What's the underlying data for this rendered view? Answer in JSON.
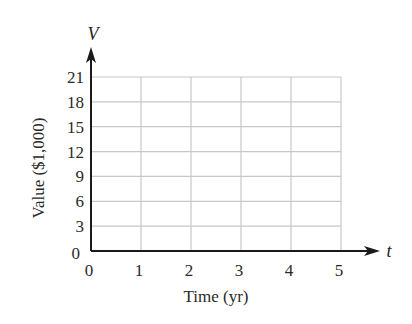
{
  "chart_data": {
    "type": "line",
    "title": "",
    "xlabel": "Time (yr)",
    "ylabel": "Value ($1,000)",
    "x_variable": "t",
    "y_variable": "V",
    "x_ticks": [
      "0",
      "1",
      "2",
      "3",
      "4",
      "5"
    ],
    "y_ticks": [
      "0",
      "3",
      "6",
      "9",
      "12",
      "15",
      "18",
      "21"
    ],
    "xlim": [
      0,
      5
    ],
    "ylim": [
      0,
      21
    ],
    "grid": true,
    "series": [],
    "colors": {
      "axis": "#1a1a1a",
      "grid": "#c8c8c8",
      "text": "#2a2a2a"
    }
  }
}
